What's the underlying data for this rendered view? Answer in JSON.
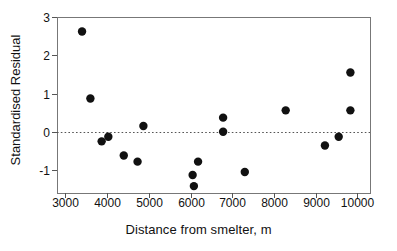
{
  "chart_data": {
    "type": "scatter",
    "title": "",
    "xlabel": "Distance from smelter, m",
    "ylabel": "Standardised Residual",
    "xlim": [
      2800,
      10300
    ],
    "ylim": [
      -1.6,
      3.0
    ],
    "xticks": [
      3000,
      4000,
      5000,
      6000,
      7000,
      8000,
      9000,
      10000
    ],
    "xticklabels": [
      "3000",
      "4000",
      "5000",
      "6000",
      "7000",
      "8000",
      "9000",
      "10000"
    ],
    "yticks": [
      -1,
      0,
      1,
      2,
      3
    ],
    "yticklabels": [
      "-1",
      "0",
      "1",
      "2",
      "3"
    ],
    "grid": false,
    "legend": null,
    "reference_line": {
      "orientation": "horizontal",
      "value": 0,
      "style": "dotted",
      "color": "#555555"
    },
    "marker": {
      "shape": "circle",
      "color": "#111111",
      "size": 4.2
    },
    "frame": {
      "color": "#777777",
      "visible": true
    },
    "points": [
      {
        "x": 3400,
        "y": 2.62
      },
      {
        "x": 3600,
        "y": 0.87
      },
      {
        "x": 3870,
        "y": -0.25
      },
      {
        "x": 4030,
        "y": -0.13
      },
      {
        "x": 4400,
        "y": -0.62
      },
      {
        "x": 4730,
        "y": -0.78
      },
      {
        "x": 4870,
        "y": 0.15
      },
      {
        "x": 6050,
        "y": -1.13
      },
      {
        "x": 6080,
        "y": -1.42
      },
      {
        "x": 6180,
        "y": -0.78
      },
      {
        "x": 6780,
        "y": 0.37
      },
      {
        "x": 6780,
        "y": 0.0
      },
      {
        "x": 7300,
        "y": -1.05
      },
      {
        "x": 8280,
        "y": 0.56
      },
      {
        "x": 9220,
        "y": -0.36
      },
      {
        "x": 9550,
        "y": -0.13
      },
      {
        "x": 9830,
        "y": 1.55
      },
      {
        "x": 9830,
        "y": 0.56
      }
    ]
  },
  "axes": {
    "xlabel": "Distance from smelter, m",
    "ylabel": "Standardised Residual"
  }
}
